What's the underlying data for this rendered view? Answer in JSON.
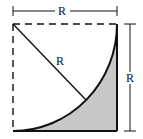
{
  "diagram": {
    "type": "geometry",
    "labels": {
      "top_dimension": "R",
      "radius": "R",
      "right_dimension": "R"
    },
    "colors": {
      "stroke": "#111111",
      "shaded_fill": "#c8c8c8",
      "background": "#ffffff"
    }
  }
}
